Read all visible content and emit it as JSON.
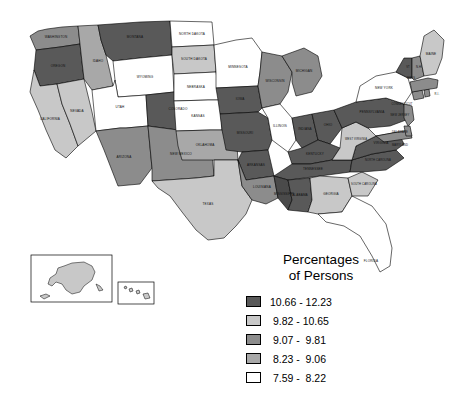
{
  "legend": {
    "title_line1": "Percentages",
    "title_line2": "of Persons",
    "classes": [
      {
        "label": "10.66 - 12.23",
        "color": "#595959",
        "min": 10.66,
        "max": 12.23
      },
      {
        "label": " 9.82 - 10.65",
        "color": "#c8c8c8",
        "min": 9.82,
        "max": 10.65
      },
      {
        "label": " 9.07 -  9.81",
        "color": "#8c8c8c",
        "min": 9.07,
        "max": 9.81
      },
      {
        "label": " 8.23 -  9.06",
        "color": "#a8a8a8",
        "min": 8.23,
        "max": 9.06
      },
      {
        "label": " 7.59 -  8.22",
        "color": "#ffffff",
        "min": 7.59,
        "max": 8.22
      }
    ]
  },
  "chart_data": {
    "type": "choropleth",
    "title": "Percentages of Persons",
    "legend_position": "bottom-right",
    "value_unit": "percent",
    "classes": [
      {
        "label": "10.66 - 12.23",
        "color": "#595959"
      },
      {
        "label": "9.82 - 10.65",
        "color": "#c8c8c8"
      },
      {
        "label": "9.07 - 9.81",
        "color": "#8c8c8c"
      },
      {
        "label": "8.23 - 9.06",
        "color": "#a8a8a8"
      },
      {
        "label": "7.59 - 8.22",
        "color": "#ffffff"
      }
    ],
    "regions": [
      {
        "name": "WASHINGTON",
        "label": "WASHINGTON",
        "class": 2,
        "color": "#8c8c8c"
      },
      {
        "name": "OREGON",
        "label": "OREGON",
        "class": 0,
        "color": "#595959"
      },
      {
        "name": "IDAHO",
        "label": "IDAHO",
        "class": 3,
        "color": "#a8a8a8"
      },
      {
        "name": "MONTANA",
        "label": "MONTANA",
        "class": 0,
        "color": "#595959"
      },
      {
        "name": "WYOMING",
        "label": "WYOMING",
        "class": 4,
        "color": "#ffffff"
      },
      {
        "name": "NEVADA",
        "label": "NEVADA",
        "class": 1,
        "color": "#c8c8c8"
      },
      {
        "name": "UTAH",
        "label": "UTAH",
        "class": 4,
        "color": "#ffffff"
      },
      {
        "name": "COLORADO",
        "label": "COLORADO",
        "class": 0,
        "color": "#595959"
      },
      {
        "name": "CALIFORNIA",
        "label": "CALIFORNIA",
        "class": 1,
        "color": "#c8c8c8"
      },
      {
        "name": "ARIZONA",
        "label": "ARIZONA",
        "class": 2,
        "color": "#8c8c8c"
      },
      {
        "name": "NEW MEXICO",
        "label": "NEW MEXICO",
        "class": 2,
        "color": "#8c8c8c"
      },
      {
        "name": "NORTH DAKOTA",
        "label": "NORTH DAKOTA",
        "class": 4,
        "color": "#ffffff"
      },
      {
        "name": "SOUTH DAKOTA",
        "label": "SOUTH DAKOTA",
        "class": 1,
        "color": "#c8c8c8"
      },
      {
        "name": "NEBRASKA",
        "label": "NEBRASKA",
        "class": 4,
        "color": "#ffffff"
      },
      {
        "name": "KANSAS",
        "label": "KANSAS",
        "class": 4,
        "color": "#ffffff"
      },
      {
        "name": "OKLAHOMA",
        "label": "OKLAHOMA",
        "class": 3,
        "color": "#a8a8a8"
      },
      {
        "name": "TEXAS",
        "label": "TEXAS",
        "class": 1,
        "color": "#c8c8c8"
      },
      {
        "name": "MINNESOTA",
        "label": "MINNESOTA",
        "class": 4,
        "color": "#ffffff"
      },
      {
        "name": "IOWA",
        "label": "IOWA",
        "class": 0,
        "color": "#595959"
      },
      {
        "name": "MISSOURI",
        "label": "MISSOURI",
        "class": 0,
        "color": "#595959"
      },
      {
        "name": "ARKANSAS",
        "label": "ARKANSAS",
        "class": 0,
        "color": "#595959"
      },
      {
        "name": "LOUISIANA",
        "label": "LOUISIANA",
        "class": 2,
        "color": "#8c8c8c"
      },
      {
        "name": "WISCONSIN",
        "label": "WISCONSIN",
        "class": 2,
        "color": "#8c8c8c"
      },
      {
        "name": "ILLINOIS",
        "label": "ILLINOIS",
        "class": 4,
        "color": "#ffffff"
      },
      {
        "name": "MICHIGAN",
        "label": "MICHIGAN",
        "class": 2,
        "color": "#8c8c8c"
      },
      {
        "name": "INDIANA",
        "label": "INDIANA",
        "class": 0,
        "color": "#595959"
      },
      {
        "name": "OHIO",
        "label": "OHIO",
        "class": 0,
        "color": "#595959"
      },
      {
        "name": "KENTUCKY",
        "label": "KENTUCKY",
        "class": 0,
        "color": "#595959"
      },
      {
        "name": "TENNESSEE",
        "label": "TENNESSEE",
        "class": 0,
        "color": "#595959"
      },
      {
        "name": "MISSISSIPPI",
        "label": "MISSISSIPPI",
        "class": 0,
        "color": "#4a4a4a"
      },
      {
        "name": "ALABAMA",
        "label": "ALABAMA",
        "class": 0,
        "color": "#595959"
      },
      {
        "name": "GEORGIA",
        "label": "GEORGIA",
        "class": 1,
        "color": "#c8c8c8"
      },
      {
        "name": "FLORIDA",
        "label": "FLORIDA",
        "class": 4,
        "color": "#ffffff"
      },
      {
        "name": "SOUTH CAROLINA",
        "label": "SOUTH CAROLINA",
        "class": 1,
        "color": "#c8c8c8"
      },
      {
        "name": "NORTH CAROLINA",
        "label": "NORTH CAROLINA",
        "class": 0,
        "color": "#595959"
      },
      {
        "name": "VIRGINIA",
        "label": "VIRGINIA",
        "class": 0,
        "color": "#595959"
      },
      {
        "name": "WEST VIRGINIA",
        "label": "WEST VIRGINIA",
        "class": 1,
        "color": "#c8c8c8"
      },
      {
        "name": "MARYLAND",
        "label": "MARYLAND",
        "class": 2,
        "color": "#8c8c8c"
      },
      {
        "name": "DELAWARE",
        "label": "DELAWARE",
        "class": 2,
        "color": "#8c8c8c"
      },
      {
        "name": "PENNSYLVANIA",
        "label": "PENNSYLVANIA",
        "class": 0,
        "color": "#595959"
      },
      {
        "name": "NEW JERSEY",
        "label": "NEW JERSEY",
        "class": 2,
        "color": "#8c8c8c"
      },
      {
        "name": "NEW YORK",
        "label": "NEW YORK",
        "class": 4,
        "color": "#ffffff"
      },
      {
        "name": "CONNECTICUT",
        "label": "CONNECTICUT",
        "class": 2,
        "color": "#8c8c8c"
      },
      {
        "name": "RHODE ISLAND",
        "label": "R.I.",
        "class": 2,
        "color": "#8c8c8c"
      },
      {
        "name": "MASSACHUSETTS",
        "label": "MASS",
        "class": 2,
        "color": "#8c8c8c"
      },
      {
        "name": "VERMONT",
        "label": "VT",
        "class": 0,
        "color": "#595959"
      },
      {
        "name": "NEW HAMPSHIRE",
        "label": "N.H.",
        "class": 2,
        "color": "#8c8c8c"
      },
      {
        "name": "MAINE",
        "label": "MAINE",
        "class": 1,
        "color": "#c8c8c8"
      },
      {
        "name": "ALASKA",
        "label": "ALASKA",
        "class": 1,
        "color": "#c8c8c8"
      },
      {
        "name": "HAWAII",
        "label": "HAWAII",
        "class": 1,
        "color": "#c8c8c8"
      }
    ]
  },
  "insets": {
    "alaska_label": "ALASKA",
    "hawaii_label": "HAWAII"
  }
}
